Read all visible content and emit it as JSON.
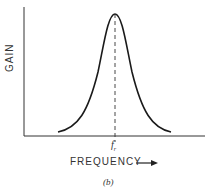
{
  "figure": {
    "y_axis_label": "GAIN",
    "x_axis_label": "FREQUENCY",
    "x_axis_arrow": "right-arrow",
    "peak_label_main": "f",
    "peak_label_sub": "r",
    "caption": "(b)"
  },
  "colors": {
    "line": "#1a1a1a",
    "axis": "#333333",
    "background": "#ffffff"
  }
}
